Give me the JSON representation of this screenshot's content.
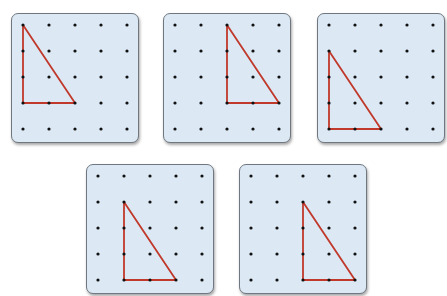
{
  "figure": {
    "grid": {
      "rows": 5,
      "cols": 5,
      "spacing": 26
    },
    "colors": {
      "board": "#dce9f5",
      "border": "#6f7780",
      "triangle": "#c0392b",
      "dot": "#111111"
    },
    "boards": [
      {
        "id": 1,
        "left": 11,
        "top": 13,
        "triangle": [
          [
            0,
            0
          ],
          [
            0,
            3
          ],
          [
            2,
            3
          ]
        ]
      },
      {
        "id": 2,
        "left": 163,
        "top": 13,
        "triangle": [
          [
            2,
            0
          ],
          [
            2,
            3
          ],
          [
            4,
            3
          ]
        ]
      },
      {
        "id": 3,
        "left": 317,
        "top": 13,
        "triangle": [
          [
            0,
            1
          ],
          [
            0,
            4
          ],
          [
            2,
            4
          ]
        ]
      },
      {
        "id": 4,
        "left": 86,
        "top": 164,
        "triangle": [
          [
            1,
            1
          ],
          [
            1,
            4
          ],
          [
            3,
            4
          ]
        ]
      },
      {
        "id": 5,
        "left": 239,
        "top": 164,
        "triangle": [
          [
            2,
            1
          ],
          [
            2,
            4
          ],
          [
            4,
            4
          ]
        ]
      }
    ]
  }
}
